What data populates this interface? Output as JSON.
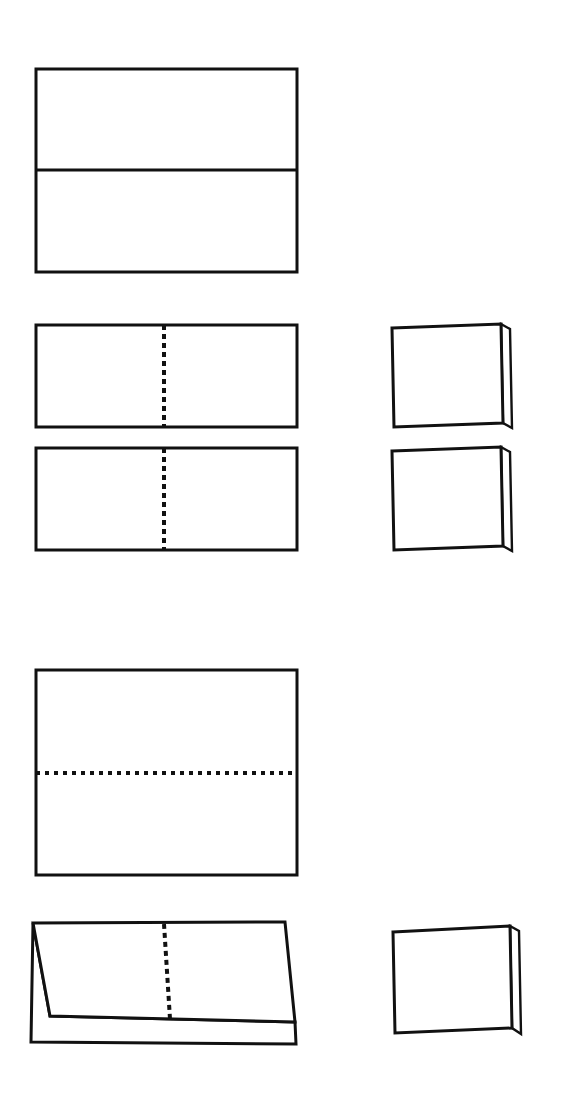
{
  "canvas": {
    "width": 569,
    "height": 1103,
    "background_color": "#ffffff",
    "ink_color": "#111111",
    "title": "Paper Folding Instruction Diagram"
  },
  "style": {
    "outline_width": 3,
    "thin_outline_width": 2.4,
    "divider_width": 3,
    "dash_width": 4,
    "dash_pattern_vertical": "5 4",
    "dash_pattern_horizontal": "4 5"
  },
  "figures": [
    {
      "id": "figure-1",
      "name": "sheet-with-center-crease",
      "step": 1,
      "kind": "flat-rectangle",
      "description": "Flat rectangular sheet with a solid horizontal crease line across the middle",
      "rect": {
        "x": 36,
        "y": 69,
        "width": 261,
        "height": 203
      },
      "divider": {
        "orientation": "horizontal",
        "y": 170,
        "x1": 36,
        "x2": 297,
        "style": "solid"
      }
    },
    {
      "id": "figure-2",
      "name": "half-sheet-upper-with-fold-line",
      "step": 2,
      "kind": "flat-rectangle",
      "description": "Rectangle with vertical dashed fold line at the center",
      "rect": {
        "x": 36,
        "y": 325,
        "width": 261,
        "height": 102
      },
      "divider": {
        "orientation": "vertical",
        "x": 164,
        "y1": 325,
        "y2": 427,
        "style": "dashed"
      }
    },
    {
      "id": "figure-3",
      "name": "half-sheet-lower-with-fold-line",
      "step": 3,
      "kind": "flat-rectangle",
      "description": "Second rectangle with vertical dashed fold line at the center",
      "rect": {
        "x": 36,
        "y": 448,
        "width": 261,
        "height": 102
      },
      "divider": {
        "orientation": "vertical",
        "x": 164,
        "y1": 448,
        "y2": 550,
        "style": "dashed"
      }
    },
    {
      "id": "figure-4",
      "name": "folded-booklet-upper",
      "step": 4,
      "kind": "folded-stack",
      "description": "Folded result: front panel with a second sheet layer peeking out at the right and bottom",
      "front_face": "392,328 501,324 503,423 394,427",
      "back_layer": "501,324 510,329 512,428 503,423"
    },
    {
      "id": "figure-5",
      "name": "folded-booklet-lower",
      "step": 5,
      "kind": "folded-stack",
      "description": "Folded result: front panel with a second sheet layer peeking out at the right and bottom",
      "front_face": "392,451 501,447 503,546 394,550",
      "back_layer": "501,447 510,452 512,551 503,546"
    },
    {
      "id": "figure-6",
      "name": "large-sheet-with-horizontal-fold",
      "step": 6,
      "kind": "flat-rectangle",
      "description": "Large rectangular sheet with a horizontal dotted fold line across the middle",
      "rect": {
        "x": 36,
        "y": 670,
        "width": 261,
        "height": 205
      },
      "divider": {
        "orientation": "horizontal",
        "y": 773,
        "x1": 36,
        "x2": 297,
        "style": "dotted"
      }
    },
    {
      "id": "figure-7",
      "name": "angled-folded-sheet-with-fold-line",
      "step": 7,
      "kind": "angled-folded-stack",
      "description": "Sheet folded in half shown at an angle, with a vertical dashed fold line and the lower layer visible beneath",
      "front_face": "33,923 285,922 295,1022 50,1016",
      "back_layer": "33,923 50,1016 295,1022 296,1044 31,1042",
      "fold_line": {
        "x1": 164,
        "y1": 924,
        "x2": 170,
        "y2": 1019,
        "style": "dashed"
      }
    },
    {
      "id": "figure-8",
      "name": "final-folded-booklet",
      "step": 8,
      "kind": "folded-stack",
      "description": "Final folded booklet: front panel with the remaining layer peeking out at the right and bottom",
      "front_face": "393,932 510,926 512,1028 395,1033",
      "back_layer": "510,926 519,931 521,1034 512,1028"
    }
  ]
}
